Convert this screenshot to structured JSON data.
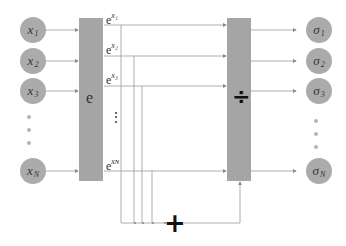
{
  "diagram": {
    "inputs": [
      {
        "base": "x",
        "sub": "1"
      },
      {
        "base": "x",
        "sub": "2"
      },
      {
        "base": "x",
        "sub": "3"
      },
      {
        "base": "x",
        "sub": "N"
      }
    ],
    "exp_block_label": "e",
    "exp_outputs": [
      {
        "base": "e",
        "sup": "x₁"
      },
      {
        "base": "e",
        "sup": "x₂"
      },
      {
        "base": "e",
        "sup": "x₃"
      },
      {
        "base": "e",
        "sup": "xɴ"
      }
    ],
    "exp_ellipsis": "⋮",
    "sum_symbol": "+",
    "divide_block_symbol": "÷",
    "outputs": [
      {
        "base": "σ",
        "sub": "1"
      },
      {
        "base": "σ",
        "sub": "2"
      },
      {
        "base": "σ",
        "sub": "3"
      },
      {
        "base": "σ",
        "sub": "N"
      }
    ],
    "colors": {
      "node_fill": "#ababab",
      "block_fill": "#a5a5a5",
      "line": "#9a9a9a",
      "symbol": "#111111"
    }
  }
}
